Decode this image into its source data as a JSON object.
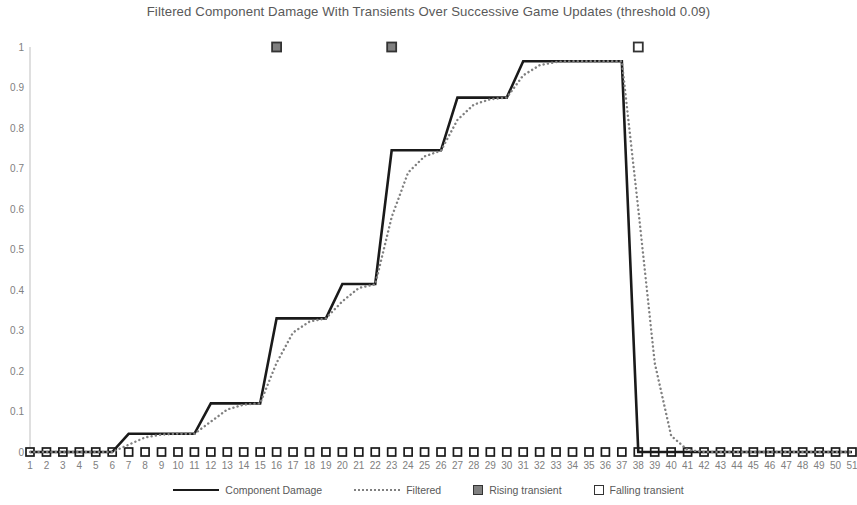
{
  "chart_data": {
    "type": "line",
    "title": "Filtered Component Damage With Transients Over Successive Game Updates (threshold 0.09)",
    "xlabel": "",
    "ylabel": "",
    "xlim": [
      1,
      51
    ],
    "ylim": [
      0,
      1
    ],
    "grid": false,
    "legend_position": "bottom",
    "threshold": 0.09,
    "x": [
      1,
      2,
      3,
      4,
      5,
      6,
      7,
      8,
      9,
      10,
      11,
      12,
      13,
      14,
      15,
      16,
      17,
      18,
      19,
      20,
      21,
      22,
      23,
      24,
      25,
      26,
      27,
      28,
      29,
      30,
      31,
      32,
      33,
      34,
      35,
      36,
      37,
      38,
      39,
      40,
      41,
      42,
      43,
      44,
      45,
      46,
      47,
      48,
      49,
      50,
      51
    ],
    "xticks": [
      "1",
      "2",
      "3",
      "4",
      "5",
      "6",
      "7",
      "8",
      "9",
      "10",
      "11",
      "12",
      "13",
      "14",
      "15",
      "16",
      "17",
      "18",
      "19",
      "20",
      "21",
      "22",
      "23",
      "24",
      "25",
      "26",
      "27",
      "28",
      "29",
      "30",
      "31",
      "32",
      "33",
      "34",
      "35",
      "36",
      "37",
      "38",
      "39",
      "40",
      "41",
      "42",
      "43",
      "44",
      "45",
      "46",
      "47",
      "48",
      "49",
      "50",
      "51"
    ],
    "yticks": [
      "0",
      "0.1",
      "0.2",
      "0.3",
      "0.4",
      "0.5",
      "0.6",
      "0.7",
      "0.8",
      "0.9",
      "1"
    ],
    "ytick_values": [
      0,
      0.1,
      0.2,
      0.3,
      0.4,
      0.5,
      0.6,
      0.7,
      0.8,
      0.9,
      1
    ],
    "series": [
      {
        "name": "Component Damage",
        "style": "solid",
        "color": "#1a1a1a",
        "values": [
          0,
          0,
          0,
          0,
          0,
          0,
          0.045,
          0.045,
          0.045,
          0.045,
          0.045,
          0.12,
          0.12,
          0.12,
          0.12,
          0.33,
          0.33,
          0.33,
          0.33,
          0.415,
          0.415,
          0.415,
          0.745,
          0.745,
          0.745,
          0.745,
          0.875,
          0.875,
          0.875,
          0.875,
          0.965,
          0.965,
          0.965,
          0.965,
          0.965,
          0.965,
          0.965,
          0,
          0,
          0,
          0,
          0,
          0,
          0,
          0,
          0,
          0,
          0,
          0,
          0,
          0
        ]
      },
      {
        "name": "Filtered",
        "style": "dotted",
        "color": "#808080",
        "values": [
          0,
          0,
          0,
          0,
          0,
          0,
          0.018,
          0.036,
          0.043,
          0.045,
          0.045,
          0.075,
          0.105,
          0.117,
          0.12,
          0.22,
          0.295,
          0.322,
          0.33,
          0.372,
          0.405,
          0.414,
          0.58,
          0.69,
          0.73,
          0.744,
          0.82,
          0.858,
          0.871,
          0.875,
          0.93,
          0.955,
          0.963,
          0.965,
          0.965,
          0.965,
          0.965,
          0.6,
          0.22,
          0.04,
          0.005,
          0,
          0,
          0,
          0,
          0,
          0,
          0,
          0,
          0,
          0
        ]
      }
    ],
    "markers": {
      "baseline": {
        "name": "Falling transient",
        "symbol": "hollow-square",
        "y": 0,
        "x": [
          1,
          2,
          3,
          4,
          5,
          6,
          7,
          8,
          9,
          10,
          11,
          12,
          13,
          14,
          15,
          16,
          17,
          18,
          19,
          20,
          21,
          22,
          23,
          24,
          25,
          26,
          27,
          28,
          29,
          30,
          31,
          32,
          33,
          34,
          35,
          36,
          37,
          38,
          39,
          40,
          41,
          42,
          43,
          44,
          45,
          46,
          47,
          48,
          49,
          50,
          51
        ]
      },
      "rising_transients": {
        "name": "Rising transient",
        "symbol": "filled-square",
        "y": 1,
        "x": [
          16,
          23
        ]
      },
      "falling_transients": {
        "name": "Falling transient",
        "symbol": "hollow-square",
        "y": 1,
        "x": [
          38
        ]
      }
    },
    "legend": [
      {
        "label": "Component Damage",
        "marker": "solid-line"
      },
      {
        "label": "Filtered",
        "marker": "dotted-line"
      },
      {
        "label": "Rising transient",
        "marker": "filled-square"
      },
      {
        "label": "Falling transient",
        "marker": "hollow-square"
      }
    ]
  },
  "legend_labels": {
    "component_damage": "Component Damage",
    "filtered": "Filtered",
    "rising_transient": "Rising transient",
    "falling_transient": "Falling transient"
  }
}
